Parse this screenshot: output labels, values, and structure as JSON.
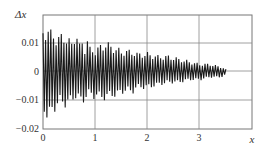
{
  "chart_data": {
    "type": "line",
    "title": "",
    "xlabel": "x",
    "ylabel": "Δx",
    "xlim": [
      0,
      4
    ],
    "ylim": [
      -0.02,
      0.02
    ],
    "x_ticks": [
      "0",
      "1",
      "2",
      "3"
    ],
    "y_ticks": [
      "0.01",
      "0",
      "−0.01",
      "−0.02"
    ],
    "grid": true,
    "legend": null,
    "series": [
      {
        "name": "Δx",
        "description": "damped oscillation decaying from about ±0.016–0.018 near x=0 to about ±0.002 near x=3.5",
        "x": [
          0.0,
          0.05,
          0.1,
          0.15,
          0.2,
          0.25,
          0.3,
          0.35,
          0.4,
          0.45,
          0.5,
          0.55,
          0.6,
          0.65,
          0.7,
          0.75,
          0.8,
          0.85,
          0.9,
          0.95,
          1.0,
          1.1,
          1.2,
          1.3,
          1.4,
          1.5,
          1.6,
          1.7,
          1.8,
          1.9,
          2.0,
          2.2,
          2.4,
          2.6,
          2.8,
          3.0,
          3.2,
          3.4,
          3.5
        ],
        "envelope_upper": [
          0.016,
          0.016,
          0.016,
          0.015,
          0.015,
          0.013,
          0.013,
          0.014,
          0.014,
          0.013,
          0.012,
          0.011,
          0.014,
          0.014,
          0.01,
          0.012,
          0.009,
          0.012,
          0.009,
          0.009,
          0.008,
          0.01,
          0.011,
          0.01,
          0.009,
          0.008,
          0.008,
          0.008,
          0.007,
          0.007,
          0.007,
          0.006,
          0.006,
          0.005,
          0.004,
          0.003,
          0.003,
          0.002,
          0.001
        ],
        "envelope_lower": [
          -0.013,
          -0.016,
          -0.018,
          -0.016,
          -0.015,
          -0.013,
          -0.012,
          -0.011,
          -0.013,
          -0.012,
          -0.012,
          -0.011,
          -0.01,
          -0.009,
          -0.011,
          -0.012,
          -0.01,
          -0.009,
          -0.008,
          -0.01,
          -0.009,
          -0.01,
          -0.01,
          -0.009,
          -0.009,
          -0.008,
          -0.007,
          -0.008,
          -0.006,
          -0.006,
          -0.006,
          -0.005,
          -0.004,
          -0.004,
          -0.003,
          -0.003,
          -0.002,
          -0.002,
          -0.001
        ]
      }
    ]
  },
  "axes": {
    "ylabel": "Δx",
    "xlabel": "x",
    "y_tick_labels": [
      "0.01",
      "0",
      "−0.01",
      "−0.02"
    ],
    "x_tick_labels": [
      "0",
      "1",
      "2",
      "3"
    ]
  },
  "colors": {
    "line": "#1a1a1a",
    "grid": "#888888",
    "frame": "#777777",
    "text": "#333333"
  }
}
